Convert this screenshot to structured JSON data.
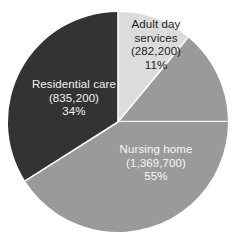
{
  "chart_data": {
    "type": "pie",
    "title": "",
    "subtitle": "",
    "xlabel": "",
    "ylabel": "",
    "legend_position": "none",
    "grid": false,
    "labels_inside_slices": true,
    "start_angle_deg": 0,
    "direction": "clockwise",
    "categories": [
      "Adult day services",
      "Nursing home",
      "Residential care"
    ],
    "values": [
      282200,
      1369700,
      835200
    ],
    "percentages": [
      11,
      55,
      34
    ],
    "value_labels": [
      "(282,200)",
      "(1,369,700)",
      "(835,200)"
    ],
    "percent_labels": [
      "11%",
      "55%",
      "34%"
    ],
    "colors": [
      "#dcdcdc",
      "#9a9a9a",
      "#333333"
    ],
    "label_colors": [
      "#1c1c1c",
      "#f7f7f7",
      "#f2f2f2"
    ],
    "separator_color": "#ffffff",
    "background_color": "#ffffff",
    "slices": [
      {
        "name": "Adult day services",
        "name_lines": [
          "Adult day",
          "services"
        ],
        "value": 282200,
        "value_label": "(282,200)",
        "percent": 11,
        "percent_label": "11%",
        "color": "#dcdcdc",
        "start_deg": 0,
        "end_deg": 39.6
      },
      {
        "name": "Nursing home",
        "name_lines": [
          "Nursing home"
        ],
        "value": 1369700,
        "value_label": "(1,369,700)",
        "percent": 55,
        "percent_label": "55%",
        "color": "#9a9a9a",
        "start_deg": 39.6,
        "end_deg": 237.6
      },
      {
        "name": "Residential care",
        "name_lines": [
          "Residential care"
        ],
        "value": 835200,
        "value_label": "(835,200)",
        "percent": 34,
        "percent_label": "34%",
        "color": "#333333",
        "start_deg": 237.6,
        "end_deg": 360
      }
    ]
  },
  "labels": {
    "adult_day": {
      "line1": "Adult day",
      "line2": "services",
      "line3": "(282,200)",
      "line4": "11%"
    },
    "residential_care": {
      "line1": "Residential care",
      "line2": "(835,200)",
      "line3": "34%"
    },
    "nursing_home": {
      "line1": "Nursing home",
      "line2": "(1,369,700)",
      "line3": "55%"
    }
  }
}
